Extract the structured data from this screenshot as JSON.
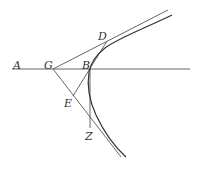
{
  "diagram": {
    "type": "geometric construction (hyperbola with tangent)",
    "colors": {
      "line": "#555555",
      "curve": "#333333",
      "label": "#333333",
      "background": "#ffffff"
    },
    "labels": {
      "A": "A",
      "G": "G",
      "B": "B",
      "D": "D",
      "E": "E",
      "Z": "Z"
    },
    "points": {
      "G": [
        53,
        69
      ],
      "B": [
        90,
        69
      ],
      "D": [
        107,
        41
      ],
      "E": [
        73,
        96
      ],
      "Z": [
        90,
        128
      ]
    }
  }
}
